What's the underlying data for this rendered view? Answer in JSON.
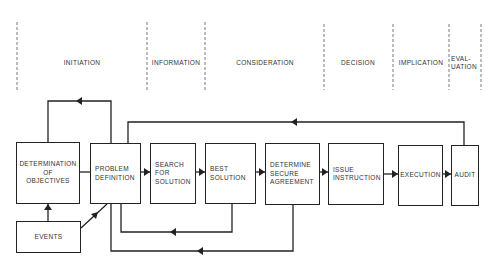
{
  "phases": [
    {
      "label": "INITIATION",
      "x": 82
    },
    {
      "label": "INFORMATION",
      "x": 176
    },
    {
      "label": "CONSIDERATION",
      "x": 265
    },
    {
      "label": "DECISION",
      "x": 358
    },
    {
      "label": "IMPLICATION",
      "x": 421
    },
    {
      "label": "EVAL-\nUATION",
      "x": 465
    }
  ],
  "phase_dividers_x": [
    17,
    147,
    205,
    324,
    393,
    449,
    481
  ],
  "boxes": {
    "determination_of_objectives": "DETERMINATION\nOF\nOBJECTIVES",
    "problem_definition": "PROBLEM\nDEFINITION",
    "search_for_solution": "SEARCH\nFOR\nSOLUTION",
    "best_solution": "BEST\nSOLUTION",
    "determine_secure_agreement": "DETERMINE\nSECURE\nAGREEMENT",
    "issue_instruction": "ISSUE\nINSTRUCTION",
    "execution": "EXECUTION",
    "audit": "AUDIT",
    "events": "EVENTS"
  },
  "colors": {
    "line": "#222222",
    "text": "#333333",
    "divider": "#555555",
    "background": "#ffffff"
  }
}
